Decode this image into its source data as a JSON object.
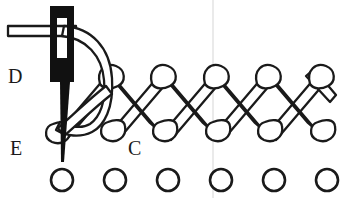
{
  "figure": {
    "width": 357,
    "height": 198,
    "background_color": "#ffffff",
    "ink_color": "#1a1a1a",
    "fill_color": "#ffffff",
    "needle_color": "#111111",
    "guide_line_color": "#dcdcdc"
  },
  "labels": [
    {
      "id": "D",
      "text": "D",
      "x": 8,
      "y": 66,
      "role": "upper-left-reference-point"
    },
    {
      "id": "E",
      "text": "E",
      "x": 10,
      "y": 138,
      "role": "needle-entry-point"
    },
    {
      "id": "C",
      "text": "C",
      "x": 128,
      "y": 138,
      "role": "lower-row-reference-point"
    }
  ],
  "stitch": {
    "type": "herringbone",
    "top_row_y": 74,
    "bottom_row_y": 128,
    "crossings": 5,
    "loop_radius": 11,
    "top_loop_x": [
      108,
      160,
      213,
      265,
      318
    ],
    "bottom_loop_x": [
      62,
      114,
      167,
      219,
      272,
      325
    ],
    "stroke_width": 2.2,
    "band_width": 9
  },
  "fabric_holes": {
    "count": 6,
    "radius": 11,
    "row_y": 180,
    "x_positions": [
      62,
      115,
      168,
      221,
      274,
      327
    ],
    "stroke_width": 2.6
  },
  "needle": {
    "x": 52,
    "top_y": 6,
    "body_bottom_y": 82,
    "width": 22,
    "eye": {
      "x": 58,
      "y": 20,
      "width": 6,
      "height": 40,
      "shape": "slot"
    },
    "tip_y": 162,
    "entry_point": "E"
  },
  "thread": {
    "free_end_x": 8,
    "free_end_y": 32,
    "color": "#1a1a1a",
    "description": "Thread tail runs left from the needle eye, loops over the needle and down through the stitching to point E."
  },
  "guide_line": {
    "x": 213,
    "y1": 0,
    "y2": 198,
    "color": "#dcdcdc"
  }
}
